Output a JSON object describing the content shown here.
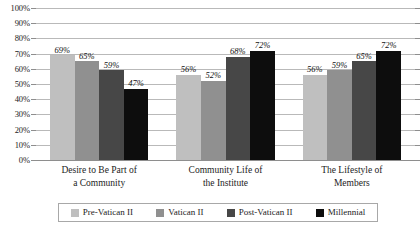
{
  "chart_data": {
    "type": "bar",
    "title": "",
    "subtitle": "",
    "xlabel": "",
    "ylabel": "",
    "ylim": [
      0,
      100
    ],
    "y_tick_suffix": "%",
    "y_ticks": [
      100,
      90,
      80,
      70,
      60,
      50,
      40,
      30,
      20,
      10,
      0
    ],
    "y_tick_labels": [
      "100%",
      "90%",
      "80%",
      "70%",
      "60%",
      "50%",
      "40%",
      "30%",
      "20%",
      "10%",
      "0%"
    ],
    "grid": true,
    "legend_position": "bottom",
    "categories": [
      "Desire to Be Part of a Community",
      "Community Life of the Institute",
      "The Lifestyle of Members"
    ],
    "category_lines": [
      [
        "Desire to Be Part of",
        "a Community"
      ],
      [
        "Community Life of",
        "the Institute"
      ],
      [
        "The Lifestyle of",
        "Members"
      ]
    ],
    "series": [
      {
        "name": "Pre-Vatican II",
        "color": "#bfbfbf",
        "values": [
          69,
          56,
          56
        ],
        "labels": [
          "69%",
          "56%",
          "56%"
        ]
      },
      {
        "name": "Vatican II",
        "color": "#909090",
        "values": [
          65,
          52,
          59
        ],
        "labels": [
          "65%",
          "52%",
          "59%"
        ]
      },
      {
        "name": "Post-Vatican II",
        "color": "#474747",
        "values": [
          59,
          68,
          65
        ],
        "labels": [
          "59%",
          "68%",
          "65%"
        ]
      },
      {
        "name": "Millennial",
        "color": "#0d0d0d",
        "values": [
          47,
          72,
          72
        ],
        "labels": [
          "47%",
          "72%",
          "72%"
        ]
      }
    ]
  },
  "legend": {
    "items": [
      {
        "label": "Pre-Vatican II",
        "color": "#bfbfbf"
      },
      {
        "label": "Vatican II",
        "color": "#909090"
      },
      {
        "label": "Post-Vatican II",
        "color": "#474747"
      },
      {
        "label": "Millennial",
        "color": "#0d0d0d"
      }
    ]
  },
  "colors": {
    "gridline": "#b9b9b9",
    "axis": "#8e8e8e",
    "text": "#1c1c1c",
    "background": "#ffffff",
    "legend_border": "#a8a8a8"
  }
}
